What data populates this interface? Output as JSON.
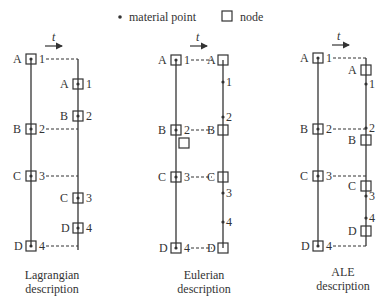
{
  "legend": {
    "material_point_label": "material point",
    "node_label": "node"
  },
  "time_symbol": "t",
  "panels": [
    {
      "caption_line1": "Lagrangian",
      "caption_line2": "description",
      "left_labels": [
        "A",
        "B",
        "C",
        "D"
      ],
      "left_numbers": [
        "1",
        "2",
        "3",
        "4"
      ],
      "right_letters": [
        "A",
        "B",
        "C",
        "D"
      ],
      "right_numbers": [
        "1",
        "2",
        "3",
        "4"
      ]
    },
    {
      "caption_line1": "Eulerian",
      "caption_line2": "description",
      "left_labels": [
        "A",
        "B",
        "C",
        "D"
      ],
      "left_numbers": [
        "1",
        "2",
        "3",
        "4"
      ],
      "right_letters": [
        "A",
        "B",
        "C",
        "D"
      ],
      "right_numbers": [
        "1",
        "2",
        "3",
        "4"
      ]
    },
    {
      "caption_line1": "ALE",
      "caption_line2": "description",
      "left_labels": [
        "A",
        "B",
        "C",
        "D"
      ],
      "left_numbers": [
        "1",
        "2",
        "3",
        "4"
      ],
      "right_letters": [
        "A",
        "B",
        "C",
        "D"
      ],
      "right_numbers": [
        "1",
        "2",
        "3",
        "4"
      ]
    }
  ]
}
